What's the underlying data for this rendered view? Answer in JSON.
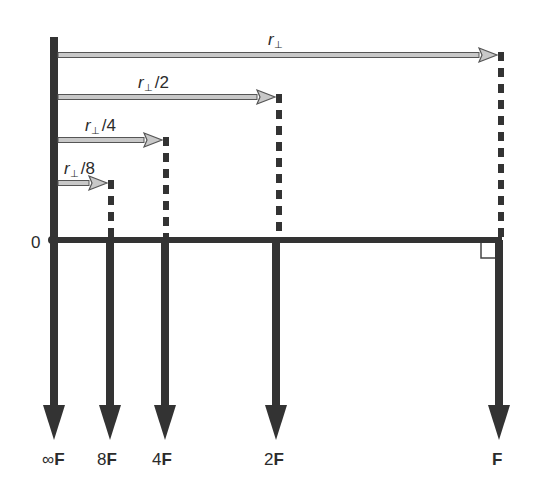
{
  "diagram": {
    "origin_label": "0",
    "colors": {
      "axis": "#333333",
      "gray_arrow_fill": "#c8c8c8",
      "gray_arrow_stroke": "#555555",
      "text": "#2b2b2b",
      "background": "#ffffff"
    },
    "lever_arms": [
      {
        "label_base": "r",
        "label_sub": "⊥",
        "label_suffix": "",
        "y": 55,
        "x_end": 497,
        "label_x": 268,
        "label_y": 45,
        "italic": true
      },
      {
        "label_base": "r",
        "label_sub": "⊥",
        "label_suffix": "/2",
        "y": 97,
        "x_end": 275,
        "label_x": 138,
        "label_y": 88,
        "italic": false
      },
      {
        "label_base": "r",
        "label_sub": "⊥",
        "label_suffix": "/4",
        "y": 140,
        "x_end": 162,
        "label_x": 85,
        "label_y": 131,
        "italic": false
      },
      {
        "label_base": "r",
        "label_sub": "⊥",
        "label_suffix": "/8",
        "y": 183,
        "x_end": 107,
        "label_x": 64,
        "label_y": 174,
        "italic": false
      }
    ],
    "forces": [
      {
        "multiplier": "∞",
        "unit": "F",
        "x": 54,
        "label_x": 42
      },
      {
        "multiplier": "8",
        "unit": "F",
        "x": 110,
        "label_x": 97
      },
      {
        "multiplier": "4",
        "unit": "F",
        "x": 165,
        "label_x": 152
      },
      {
        "multiplier": "2",
        "unit": "F",
        "x": 276,
        "label_x": 264
      },
      {
        "multiplier": "",
        "unit": "F",
        "x": 499,
        "label_x": 492
      }
    ],
    "right_angle_marker": true
  }
}
